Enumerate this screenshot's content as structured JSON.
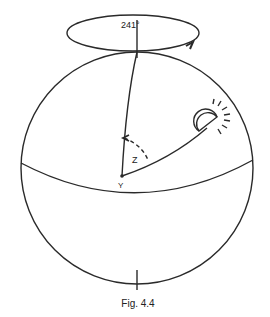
{
  "figure": {
    "caption": "Fig. 4.4",
    "labels": {
      "azimuth": "241°",
      "angle": "Z",
      "point": "Y"
    },
    "icons": {
      "sun": "sun-icon"
    },
    "colors": {
      "stroke": "#2a2a2a",
      "background": "#ffffff"
    }
  }
}
